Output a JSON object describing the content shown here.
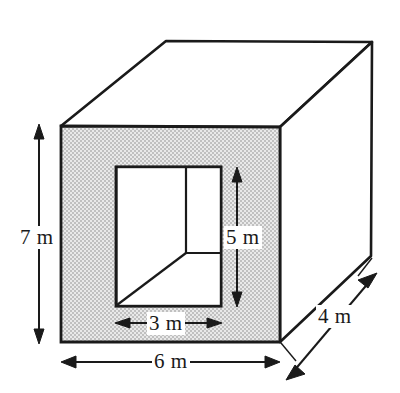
{
  "figure": {
    "colors": {
      "stroke": "#1a1a1a",
      "front_face_fill": "#d2d2d2",
      "background": "#ffffff",
      "label_text": "#1a1a1a"
    },
    "dimensions": [
      {
        "id": "height",
        "value": "7 m",
        "orientation": "vertical",
        "measures": "overall height of box front face"
      },
      {
        "id": "opening-height",
        "value": "5 m",
        "orientation": "vertical",
        "measures": "height of rectangular opening"
      },
      {
        "id": "opening-width",
        "value": "3 m",
        "orientation": "horizontal",
        "measures": "width of rectangular opening"
      },
      {
        "id": "width",
        "value": "6 m",
        "orientation": "horizontal",
        "measures": "overall width of box front face"
      },
      {
        "id": "depth",
        "value": "4 m",
        "orientation": "diagonal",
        "measures": "depth of box"
      }
    ],
    "geometry": {
      "front_face": {
        "left": 61,
        "top": 126,
        "right": 280,
        "bottom": 342
      },
      "back_top_left": {
        "x": 166,
        "y": 41
      },
      "back_top_right": {
        "x": 372,
        "y": 42
      },
      "back_bottom_right": {
        "x": 371,
        "y": 256
      },
      "opening": {
        "left": 116,
        "top": 167,
        "right": 221,
        "bottom": 306
      },
      "opening_inner_vertical_x": 186,
      "opening_inner_shelf_y": 253
    }
  }
}
